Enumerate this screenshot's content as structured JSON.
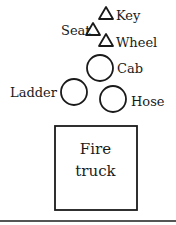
{
  "diagram": {
    "type": "decomposition-tree",
    "root": {
      "label_line1": "Fire",
      "label_line2": "truck",
      "shape": "square"
    },
    "circles": [
      {
        "id": "cab",
        "label": "Cab"
      },
      {
        "id": "ladder",
        "label": "Ladder"
      },
      {
        "id": "hose",
        "label": "Hose"
      }
    ],
    "triangles": [
      {
        "id": "key",
        "label": "Key"
      },
      {
        "id": "seat",
        "label": "Seat"
      },
      {
        "id": "wheel",
        "label": "Wheel"
      }
    ],
    "stroke_color": "#1a1a1a"
  }
}
